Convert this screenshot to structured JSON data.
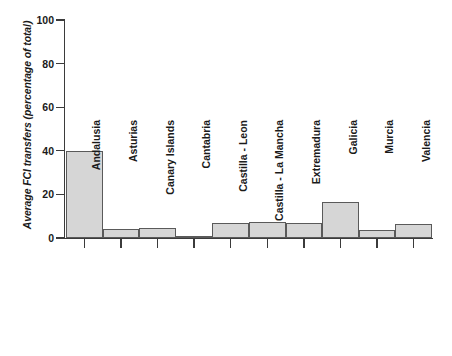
{
  "chart_data": {
    "type": "bar",
    "title": "",
    "xlabel": "",
    "ylabel": "Average FCI transfers (percentage of total)",
    "ylim": [
      0,
      100
    ],
    "yticks": [
      0,
      20,
      40,
      60,
      80,
      100
    ],
    "grid": false,
    "legend": null,
    "categories": [
      "Andalusia",
      "Asturias",
      "Canary Islands",
      "Cantabria",
      "Castilla - Leon",
      "Castilla - La Mancha",
      "Extremadura",
      "Galicia",
      "Murcia",
      "Valencia"
    ],
    "values": [
      40,
      4,
      4.5,
      1,
      7,
      7.5,
      7,
      16.5,
      3.5,
      6.5
    ],
    "bar_fill_color": "#d6d6d6",
    "bar_border_color": "#5a5a5a",
    "axis_color": "#3b3b3b"
  },
  "axis": {
    "y_tick_labels": [
      "0",
      "20",
      "40",
      "60",
      "80",
      "100"
    ],
    "y_label_text": "Average FCI transfers (percentage of total)"
  }
}
